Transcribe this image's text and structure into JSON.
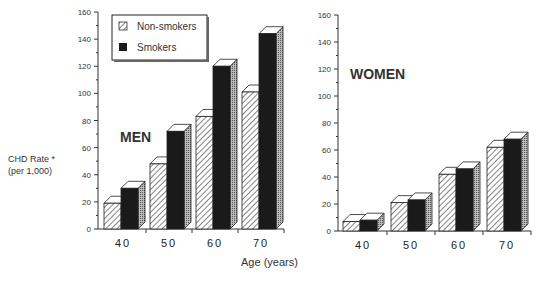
{
  "chart_data": [
    {
      "type": "bar",
      "title": "MEN",
      "categories": [
        "40",
        "50",
        "60",
        "70"
      ],
      "series": [
        {
          "name": "Non-smokers",
          "values": [
            19,
            48,
            83,
            101
          ]
        },
        {
          "name": "Smokers",
          "values": [
            30,
            72,
            120,
            144
          ]
        }
      ],
      "xlabel": "Age (years)",
      "ylabel": "CHD Rate * (per 1,000)",
      "ylim": [
        0,
        160
      ],
      "yticks": [
        0,
        20,
        40,
        60,
        80,
        100,
        120,
        140,
        160
      ],
      "grid": false,
      "legend_position": "top-left"
    },
    {
      "type": "bar",
      "title": "WOMEN",
      "categories": [
        "40",
        "50",
        "60",
        "70"
      ],
      "series": [
        {
          "name": "Non-smokers",
          "values": [
            7,
            21,
            42,
            62
          ]
        },
        {
          "name": "Smokers",
          "values": [
            8,
            23,
            46,
            68
          ]
        }
      ],
      "xlabel": "Age (years)",
      "ylim": [
        0,
        160
      ],
      "yticks": [
        0,
        20,
        40,
        60,
        80,
        100,
        120,
        140,
        160
      ],
      "grid": false
    }
  ],
  "labels": {
    "ylabel_line1": "CHD Rate *",
    "ylabel_line2": "(per   1,000)",
    "xlabel": "Age  (years)",
    "men": "MEN",
    "women": "WOMEN",
    "legend_nonsmokers": "Non-smokers",
    "legend_smokers": "Smokers"
  }
}
